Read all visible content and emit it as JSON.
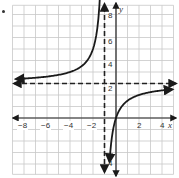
{
  "chart_data": {
    "type": "line",
    "title": "",
    "function": "y = 3 - 3/(x+1)",
    "xlabel": "x",
    "ylabel": "y",
    "xlim": [
      -9,
      5
    ],
    "ylim": [
      -5,
      9.8
    ],
    "grid": true,
    "x_ticks": [
      -8,
      -6,
      -4,
      -2,
      2,
      4
    ],
    "y_ticks": [
      8,
      6,
      4,
      2,
      -4
    ],
    "x_tick_labels": [
      "−8",
      "−6",
      "−4",
      "−2",
      "2",
      "4"
    ],
    "y_tick_labels": [
      "8",
      "6",
      "4",
      "2",
      "4"
    ],
    "asymptotes": [
      {
        "type": "vertical",
        "value": -1,
        "style": "dashed"
      },
      {
        "type": "horizontal",
        "value": 3,
        "style": "dashed"
      }
    ],
    "series": [
      {
        "name": "left-branch",
        "x": [
          -9,
          -8,
          -6,
          -4,
          -3,
          -2,
          -1.5,
          -1.3
        ],
        "y": [
          3.375,
          3.43,
          3.6,
          4.0,
          4.5,
          6.0,
          9.0,
          13.0
        ]
      },
      {
        "name": "right-branch",
        "x": [
          -0.55,
          -0.5,
          0,
          1,
          2,
          3,
          4,
          5
        ],
        "y": [
          -3.67,
          -3.0,
          0,
          1.5,
          2.0,
          2.25,
          2.4,
          2.5
        ]
      }
    ],
    "colors": {
      "curve": "#1a1a1a",
      "grid": "#c8c8c8",
      "axis": "#222222",
      "asymptote": "#222222"
    }
  },
  "labels": {
    "x_axis": "x",
    "y_axis": "y",
    "xt_m8": "−8",
    "xt_m6": "−6",
    "xt_m4": "−4",
    "xt_m2": "−2",
    "xt_2": "2",
    "xt_4": "4",
    "yt_8": "8",
    "yt_6": "6",
    "yt_4": "4",
    "yt_2": "2",
    "yt_m4": "4"
  }
}
